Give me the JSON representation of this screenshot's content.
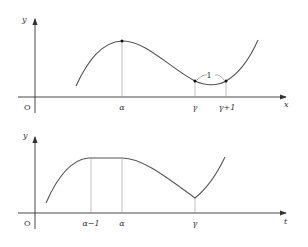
{
  "top_graph": {
    "y_axis_label": "y",
    "x_axis_label": "x",
    "origin_label": "O",
    "tick_alpha": "α",
    "tick_gamma": "γ",
    "tick_gamma_plus_1": "γ+1",
    "interval_label": "1"
  },
  "bottom_graph": {
    "y_axis_label": "y",
    "x_axis_label": "t",
    "origin_label": "O",
    "tick_alpha_minus_1": "α−1",
    "tick_alpha": "α",
    "tick_gamma": "γ"
  },
  "colors": {
    "axis": "#333333",
    "curve": "#555555",
    "guide": "#999999"
  }
}
